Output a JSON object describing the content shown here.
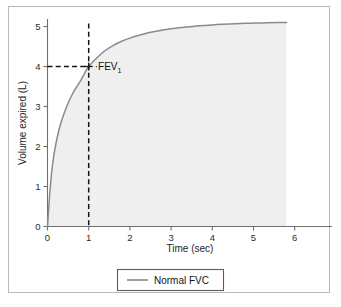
{
  "chart_data": {
    "type": "line",
    "title": "",
    "xlabel": "Time (sec)",
    "ylabel": "Volume expired (L)",
    "xlim": [
      0,
      6.4
    ],
    "ylim": [
      0,
      5.45
    ],
    "xticks": [
      "0",
      "1",
      "2",
      "3",
      "4",
      "5",
      "6"
    ],
    "yticks": [
      "0",
      "1",
      "2",
      "3",
      "4",
      "5"
    ],
    "grid": false,
    "legend_position": "below-axes",
    "series": [
      {
        "name": "Normal FVC",
        "color": "#8a8a8a",
        "x": [
          0,
          0.05,
          0.1,
          0.15,
          0.2,
          0.3,
          0.4,
          0.5,
          0.6,
          0.7,
          0.8,
          0.9,
          1.0,
          1.2,
          1.4,
          1.6,
          1.8,
          2.0,
          2.4,
          2.8,
          3.2,
          3.6,
          4.0,
          4.4,
          4.8,
          5.2,
          5.6,
          5.8
        ],
        "y": [
          0,
          0.75,
          1.35,
          1.75,
          2.05,
          2.5,
          2.82,
          3.08,
          3.3,
          3.48,
          3.64,
          3.83,
          4.0,
          4.22,
          4.4,
          4.53,
          4.63,
          4.71,
          4.83,
          4.91,
          4.97,
          5.01,
          5.04,
          5.06,
          5.08,
          5.09,
          5.1,
          5.1
        ]
      }
    ],
    "annotations": [
      {
        "name": "FEV1",
        "label": "FEV",
        "subscript": "1",
        "point_x": 1.0,
        "point_y": 4.0,
        "marker": "plus",
        "guides": [
          "vertical-dashed-to-x-axis",
          "horizontal-dashed-to-y-axis"
        ],
        "leader": "·"
      }
    ]
  },
  "legend": {
    "entries": [
      {
        "label": "Normal FVC",
        "color": "#8a8a8a"
      }
    ]
  }
}
